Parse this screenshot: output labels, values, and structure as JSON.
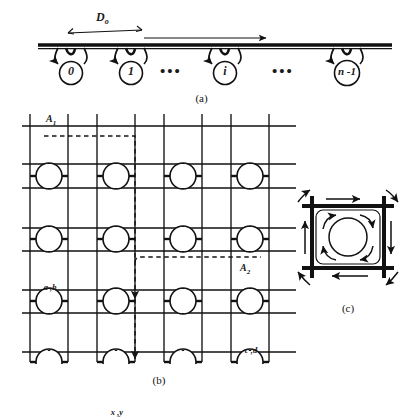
{
  "figure": {
    "type": "network-topology-diagram",
    "panels": [
      {
        "id": "a",
        "caption": "(a)",
        "name": "linear-bus-array",
        "distance_label": "D",
        "distance_subscript": "o",
        "nodes": [
          {
            "label": "0"
          },
          {
            "label": "1"
          },
          {
            "label": "i"
          },
          {
            "label": "n -1"
          }
        ],
        "ellipses": [
          "•••",
          "•••"
        ],
        "direction_arrow": "rightward-flow-arrow"
      },
      {
        "id": "b",
        "caption": "(b)",
        "name": "mesh-grid-network",
        "rows": 4,
        "cols": 4,
        "node_labels": {
          "r0c0": "a ,b",
          "r1c3": "c ,d",
          "r2c1": "x ,y",
          "r3c1": "x ,y"
        },
        "routes": [
          {
            "label": "A",
            "subscript": "1",
            "name": "route-a1"
          },
          {
            "label": "A",
            "subscript": "2",
            "name": "route-a2"
          }
        ]
      },
      {
        "id": "c",
        "caption": "(c)",
        "name": "switch-node-detail",
        "flow_arrows": [
          "top-edge-rightward",
          "right-edge-downward",
          "bottom-edge-leftward",
          "left-edge-upward",
          "inner-turn-top-left",
          "inner-turn-top-right",
          "inner-turn-bottom-right",
          "inner-turn-bottom-left",
          "corner-turn-top-left",
          "corner-turn-top-right",
          "corner-turn-bottom-right",
          "corner-turn-bottom-left"
        ],
        "center": "node-circle"
      }
    ]
  },
  "colors": {
    "ink": "#1a1a1a",
    "line": "#111111",
    "paper": "#ffffff",
    "dash": "#151515"
  }
}
